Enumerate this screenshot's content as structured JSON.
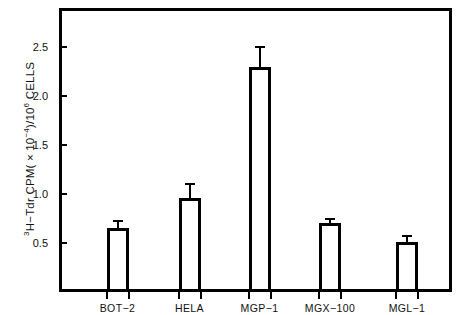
{
  "chart_data": {
    "type": "bar",
    "title": "",
    "xlabel": "",
    "ylabel": "3H−Tdr CPM( × 10−4)/106 CELLS",
    "ylabel_parts": {
      "pre_sup": "3",
      "main": "H−Tdr CPM( × 10",
      "exp1": "−4",
      "mid": ")/10",
      "exp2": "6",
      "post": " CELLS"
    },
    "categories": [
      "BOT−2",
      "HELA",
      "MGP−1",
      "MGX−100",
      "MGL−1"
    ],
    "values": [
      0.65,
      0.96,
      2.3,
      0.7,
      0.51
    ],
    "errors": [
      0.09,
      0.15,
      0.21,
      0.06,
      0.07
    ],
    "ylim": [
      0,
      2.9
    ],
    "yticks": [
      0.5,
      1.0,
      1.5,
      2.0,
      2.5
    ],
    "ytick_labels": [
      "0.5",
      "1.0",
      "1.5",
      "2.0",
      "2.5"
    ],
    "grid": false,
    "legend": false,
    "bar_facecolor": "#ffffff",
    "bar_edgecolor": "#000000",
    "frame_color": "#000000"
  }
}
